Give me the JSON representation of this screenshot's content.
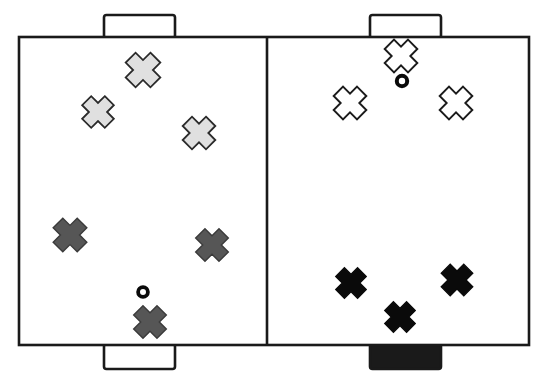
{
  "diagram": {
    "canvas": {
      "width": 547,
      "height": 382
    },
    "background_color": "#ffffff",
    "line_color": "#1a1a1a"
  },
  "court": {
    "name": "playing-court",
    "x": 19,
    "y": 37,
    "width": 510,
    "height": 308,
    "stroke_width": 2.6,
    "fill": "#ffffff",
    "center_line": {
      "name": "center-dividing-line",
      "x": 267,
      "y1": 37,
      "y2": 345,
      "stroke_width": 2.6
    }
  },
  "goals": [
    {
      "label": "top-left-goal",
      "x": 104,
      "y": 15,
      "width": 71,
      "height": 23,
      "fill": "#ffffff",
      "stroke": "#1a1a1a",
      "stroke_width": 2.6
    },
    {
      "label": "top-right-goal",
      "x": 370,
      "y": 15,
      "width": 71,
      "height": 23,
      "fill": "#ffffff",
      "stroke": "#1a1a1a",
      "stroke_width": 2.6
    },
    {
      "label": "bottom-left-goal",
      "x": 104,
      "y": 344,
      "width": 71,
      "height": 25,
      "fill": "#ffffff",
      "stroke": "#1a1a1a",
      "stroke_width": 2.6
    },
    {
      "label": "bottom-right-goal",
      "x": 370,
      "y": 344,
      "width": 71,
      "height": 25,
      "fill": "#1a1a1a",
      "stroke": "#1a1a1a",
      "stroke_width": 2.6
    }
  ],
  "markers": {
    "legend_note": "X-shaped cross markers denote players; small rings denote balls",
    "cross_fill_light_gray": "#e0e0e0",
    "cross_fill_dark_gray": "#565656",
    "cross_fill_white": "#ffffff",
    "cross_fill_black": "#0a0a0a",
    "cross_outline": "#1a1a1a",
    "ball_color": "#0a0a0a",
    "players": [
      {
        "label": "player-light-gray-1",
        "group": "light-gray",
        "half": "left",
        "cx": 143,
        "cy": 70,
        "size": 17.5,
        "fill": "#e0e0e0",
        "stroke": "#2a2a2a",
        "stroke_width": 1.8
      },
      {
        "label": "player-light-gray-2",
        "group": "light-gray",
        "half": "left",
        "cx": 98,
        "cy": 112,
        "size": 16.0,
        "fill": "#e0e0e0",
        "stroke": "#2a2a2a",
        "stroke_width": 1.8
      },
      {
        "label": "player-light-gray-3",
        "group": "light-gray",
        "half": "left",
        "cx": 199,
        "cy": 133,
        "size": 16.5,
        "fill": "#e0e0e0",
        "stroke": "#2a2a2a",
        "stroke_width": 1.8
      },
      {
        "label": "player-dark-gray-1",
        "group": "dark-gray",
        "half": "left",
        "cx": 70,
        "cy": 235,
        "size": 17.0,
        "fill": "#565656",
        "stroke": "#3a3a3a",
        "stroke_width": 1.4
      },
      {
        "label": "player-dark-gray-2",
        "group": "dark-gray",
        "half": "left",
        "cx": 212,
        "cy": 245,
        "size": 16.5,
        "fill": "#565656",
        "stroke": "#3a3a3a",
        "stroke_width": 1.4
      },
      {
        "label": "player-dark-gray-3",
        "group": "dark-gray",
        "half": "left",
        "cx": 150,
        "cy": 322,
        "size": 16.5,
        "fill": "#565656",
        "stroke": "#3a3a3a",
        "stroke_width": 1.4
      },
      {
        "label": "player-white-1",
        "group": "white",
        "half": "right",
        "cx": 401,
        "cy": 56,
        "size": 16.5,
        "fill": "#ffffff",
        "stroke": "#1a1a1a",
        "stroke_width": 1.9
      },
      {
        "label": "player-white-2",
        "group": "white",
        "half": "right",
        "cx": 350,
        "cy": 103,
        "size": 16.5,
        "fill": "#ffffff",
        "stroke": "#1a1a1a",
        "stroke_width": 1.9
      },
      {
        "label": "player-white-3",
        "group": "white",
        "half": "right",
        "cx": 456,
        "cy": 103,
        "size": 16.5,
        "fill": "#ffffff",
        "stroke": "#1a1a1a",
        "stroke_width": 1.9
      },
      {
        "label": "player-black-1",
        "group": "black",
        "half": "right",
        "cx": 351,
        "cy": 283,
        "size": 15.5,
        "fill": "#0a0a0a",
        "stroke": "#0a0a0a",
        "stroke_width": 1.2
      },
      {
        "label": "player-black-2",
        "group": "black",
        "half": "right",
        "cx": 457,
        "cy": 280,
        "size": 16.0,
        "fill": "#0a0a0a",
        "stroke": "#0a0a0a",
        "stroke_width": 1.2
      },
      {
        "label": "player-black-3",
        "group": "black",
        "half": "right",
        "cx": 400,
        "cy": 317,
        "size": 15.5,
        "fill": "#0a0a0a",
        "stroke": "#0a0a0a",
        "stroke_width": 1.2
      }
    ],
    "balls": [
      {
        "label": "ball-left-half",
        "half": "left",
        "cx": 143,
        "cy": 292,
        "r_outer": 6.8,
        "r_inner": 3.0,
        "color": "#0a0a0a"
      },
      {
        "label": "ball-right-half",
        "half": "right",
        "cx": 402,
        "cy": 81,
        "r_outer": 7.2,
        "r_inner": 3.2,
        "color": "#0a0a0a"
      }
    ]
  },
  "counts": {
    "light_gray_players": 3,
    "dark_gray_players": 3,
    "white_players": 3,
    "black_players": 3,
    "balls": 2,
    "goals": 4,
    "halves": 2
  }
}
